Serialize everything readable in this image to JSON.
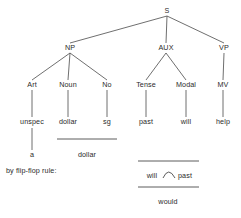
{
  "figure": {
    "ink_color": "#2b2b2b",
    "line_color": "#4a4a4a",
    "background_color": "#ffffff"
  },
  "tree": {
    "root": {
      "label": "S",
      "x": 167,
      "y": 11
    },
    "level2": [
      {
        "label": "NP",
        "x": 70,
        "y": 48
      },
      {
        "label": "AUX",
        "x": 166,
        "y": 48
      },
      {
        "label": "VP",
        "x": 224,
        "y": 48
      }
    ],
    "level3": [
      {
        "label": "Art",
        "x": 32,
        "y": 85
      },
      {
        "label": "Noun",
        "x": 68,
        "y": 85
      },
      {
        "label": "No",
        "x": 107,
        "y": 85
      },
      {
        "label": "Tense",
        "x": 146,
        "y": 85
      },
      {
        "label": "Modal",
        "x": 186,
        "y": 85
      },
      {
        "label": "MV",
        "x": 223,
        "y": 85
      }
    ],
    "terminals": [
      {
        "label": "unspec",
        "x": 32,
        "y": 122
      },
      {
        "label": "dollar",
        "x": 68,
        "y": 122
      },
      {
        "label": "sg",
        "x": 107,
        "y": 122
      },
      {
        "label": "past",
        "x": 146,
        "y": 122
      },
      {
        "label": "will",
        "x": 186,
        "y": 122
      },
      {
        "label": "help",
        "x": 223,
        "y": 122
      }
    ],
    "derived": [
      {
        "label": "a",
        "x": 32,
        "y": 155
      },
      {
        "label": "dollar",
        "x": 87,
        "y": 155
      }
    ]
  },
  "flip_flop": {
    "caption": "by flip-flop rule:",
    "caption_x": 6,
    "caption_y": 170,
    "input_left": "will",
    "input_right": "past",
    "output": "would",
    "input_left_x": 152,
    "input_right_x": 185,
    "input_y": 176,
    "output_x": 168,
    "output_y": 202
  }
}
